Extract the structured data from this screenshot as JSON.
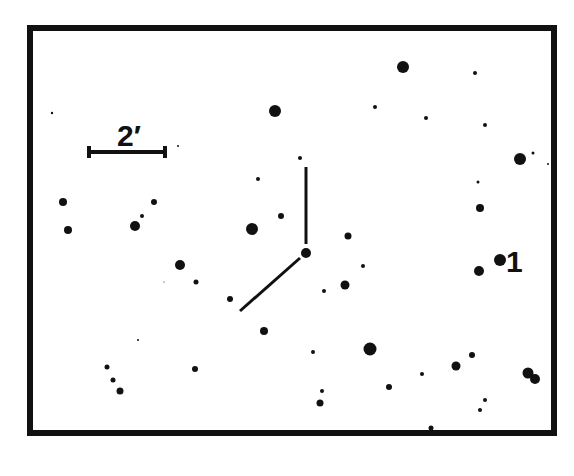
{
  "finder_chart": {
    "scale_bar": {
      "label": "2′",
      "x1": 89,
      "x2": 165,
      "y": 152
    },
    "target_label": {
      "text": "1",
      "x": 506,
      "y": 272
    },
    "frame": {
      "x": 30,
      "y": 28,
      "width": 524,
      "height": 405
    },
    "colors": {
      "ink": "#111111",
      "background": "#ffffff"
    },
    "marker_lines": [
      {
        "x1": 306,
        "y1": 167,
        "x2": 306,
        "y2": 244
      },
      {
        "x1": 300,
        "y1": 258,
        "x2": 240,
        "y2": 311
      }
    ],
    "stars": [
      [
        403,
        67,
        6
      ],
      [
        475,
        73,
        2
      ],
      [
        275,
        111,
        6
      ],
      [
        375,
        107,
        2
      ],
      [
        426,
        118,
        2
      ],
      [
        485,
        125,
        2
      ],
      [
        52,
        113,
        1.2
      ],
      [
        178,
        146,
        1
      ],
      [
        520,
        159,
        6
      ],
      [
        533,
        153,
        1.5
      ],
      [
        548,
        164,
        1
      ],
      [
        300,
        158,
        2
      ],
      [
        258,
        179,
        2
      ],
      [
        478,
        182,
        1.5
      ],
      [
        63,
        202,
        4
      ],
      [
        154,
        202,
        3
      ],
      [
        68,
        230,
        4
      ],
      [
        135,
        226,
        5
      ],
      [
        142,
        216,
        2
      ],
      [
        252,
        229,
        6
      ],
      [
        281,
        216,
        3
      ],
      [
        480,
        208,
        4
      ],
      [
        348,
        236,
        3.5
      ],
      [
        306,
        253,
        5
      ],
      [
        500,
        260,
        6
      ],
      [
        479,
        271,
        5
      ],
      [
        363,
        266,
        2
      ],
      [
        180,
        265,
        5
      ],
      [
        196,
        282,
        2.5
      ],
      [
        164,
        282,
        0.6
      ],
      [
        345,
        285,
        4.5
      ],
      [
        324,
        291,
        2
      ],
      [
        230,
        299,
        3
      ],
      [
        264,
        331,
        4
      ],
      [
        138,
        340,
        1
      ],
      [
        370,
        349,
        6.5
      ],
      [
        313,
        352,
        2
      ],
      [
        472,
        355,
        3
      ],
      [
        456,
        366,
        4.5
      ],
      [
        107,
        367,
        2.5
      ],
      [
        113,
        380,
        2.5
      ],
      [
        120,
        391,
        3.5
      ],
      [
        195,
        369,
        3
      ],
      [
        422,
        374,
        2
      ],
      [
        528,
        373,
        5.5
      ],
      [
        535,
        379,
        5
      ],
      [
        389,
        387,
        3
      ],
      [
        322,
        391,
        2
      ],
      [
        320,
        403,
        3.5
      ],
      [
        485,
        400,
        2
      ],
      [
        480,
        410,
        2
      ],
      [
        431,
        428,
        2.5
      ]
    ]
  }
}
